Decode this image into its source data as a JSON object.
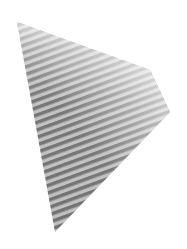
{
  "image": {
    "description": "Abstract grayscale quadrilateral with diagonal wavy stripes fading to white toward the top-right",
    "shape": {
      "points": [
        [
          17,
          22
        ],
        [
          150,
          70
        ],
        [
          170,
          112
        ],
        [
          55,
          232
        ]
      ]
    },
    "colors": {
      "background": "#ffffff",
      "stripe_dark": "#6a6a6a",
      "stripe_light": "#bdbdbd"
    },
    "stripes": {
      "angle_deg": -20,
      "period_px": 7
    }
  }
}
